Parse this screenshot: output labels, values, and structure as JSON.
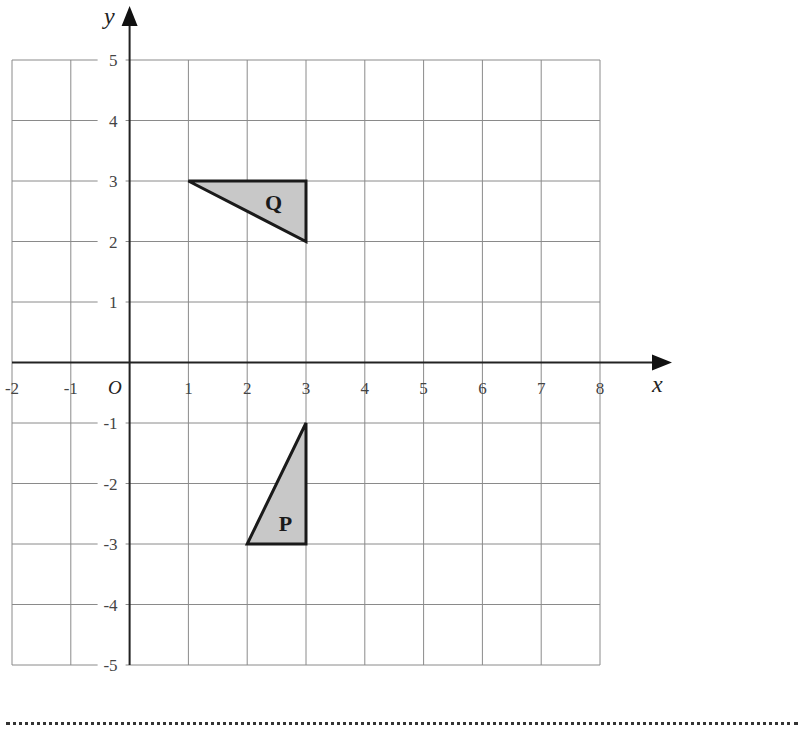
{
  "chart_data": {
    "type": "coordinate_grid",
    "title": "",
    "xlabel": "x",
    "ylabel": "y",
    "origin_label": "O",
    "xlim": [
      -2,
      8
    ],
    "ylim": [
      -5,
      5
    ],
    "grid": true,
    "x_ticks": [
      -2,
      -1,
      1,
      2,
      3,
      4,
      5,
      6,
      7,
      8
    ],
    "y_ticks": [
      5,
      4,
      3,
      2,
      1,
      -1,
      -2,
      -3,
      -4,
      -5
    ],
    "shapes": [
      {
        "name": "Q",
        "type": "triangle",
        "vertices": [
          [
            1,
            3
          ],
          [
            3,
            3
          ],
          [
            3,
            2
          ]
        ],
        "label_position": [
          2.45,
          2.65
        ],
        "fill": "#c8c8c8",
        "stroke": "#1a1a1a"
      },
      {
        "name": "P",
        "type": "triangle",
        "vertices": [
          [
            3,
            -1
          ],
          [
            3,
            -3
          ],
          [
            2,
            -3
          ]
        ],
        "label_position": [
          2.65,
          -2.65
        ],
        "fill": "#c8c8c8",
        "stroke": "#1a1a1a"
      }
    ]
  },
  "answer_line": "dotted"
}
